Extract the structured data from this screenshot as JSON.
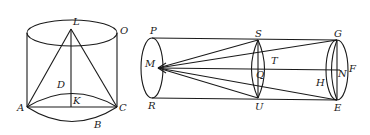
{
  "figures": [
    {
      "id": "cylinder-cone",
      "description": "Vertical cylinder with inscribed cone",
      "labels": {
        "L": "L",
        "O": "O",
        "D": "D",
        "K": "K",
        "A": "A",
        "C": "C",
        "B": "B"
      }
    },
    {
      "id": "horizontal-cylinder",
      "description": "Horizontal cylinder with rays from M",
      "labels": {
        "P": "P",
        "M": "M",
        "R": "R",
        "S": "S",
        "T": "T",
        "Q": "Q",
        "U": "U",
        "G": "G",
        "H": "H",
        "N": "N",
        "F": "F",
        "E": "E"
      }
    }
  ],
  "colors": {
    "stroke": "#1a1a1a",
    "background": "#ffffff"
  }
}
